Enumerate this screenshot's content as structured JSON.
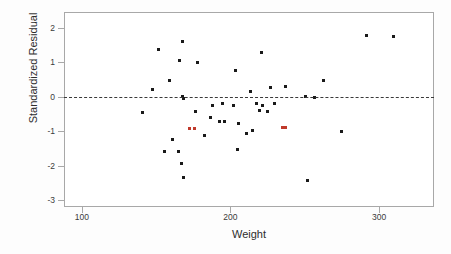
{
  "chart_data": {
    "type": "scatter",
    "title": "",
    "subtitle": "",
    "xlabel": "Weight",
    "ylabel": "Standardized Residual",
    "xlim": [
      88,
      337
    ],
    "ylim": [
      -3.2,
      2.45
    ],
    "xticks": [
      100,
      200,
      300
    ],
    "yticks": [
      2,
      1,
      0,
      -1,
      -2,
      -3
    ],
    "xtick_labels": [
      "100",
      "200",
      "300"
    ],
    "ytick_labels": [
      "2",
      "1",
      "0",
      "-1",
      "-2",
      "-3"
    ],
    "grid": false,
    "legend": "none",
    "annotations": [
      {
        "kind": "reference-line",
        "orientation": "horizontal",
        "y": 0,
        "style": "dashed",
        "color": "#3a3a3a"
      }
    ],
    "marker": {
      "shape": "square",
      "size": 3,
      "color": "#1a1a1a",
      "highlight_color": "#c0392b"
    },
    "series": [
      {
        "name": "residuals",
        "color": "#1a1a1a",
        "points": [
          {
            "x": 97,
            "y": -0.09
          },
          {
            "x": 104,
            "y": 0.59
          },
          {
            "x": 108,
            "y": 1.74
          },
          {
            "x": 115,
            "y": 0.85
          },
          {
            "x": 117,
            "y": -0.86
          },
          {
            "x": 112,
            "y": -1.22
          },
          {
            "x": 122,
            "y": 1.42
          },
          {
            "x": 124,
            "y": 1.97
          },
          {
            "x": 124,
            "y": 0.37
          },
          {
            "x": 125,
            "y": 0.32
          },
          {
            "x": 121,
            "y": -1.22
          },
          {
            "x": 123,
            "y": -1.55
          },
          {
            "x": 125,
            "y": -1.96
          },
          {
            "x": 134,
            "y": 1.36
          },
          {
            "x": 133,
            "y": -0.07
          },
          {
            "x": 139,
            "y": -0.74
          },
          {
            "x": 144,
            "y": 0.11
          },
          {
            "x": 143,
            "y": -0.23
          },
          {
            "x": 149,
            "y": -0.35
          },
          {
            "x": 152,
            "y": -0.35
          },
          {
            "x": 151,
            "y": 0.19
          },
          {
            "x": 158,
            "y": 0.12
          },
          {
            "x": 160,
            "y": 1.13
          },
          {
            "x": 162,
            "y": -0.41
          },
          {
            "x": 161,
            "y": -1.17
          },
          {
            "x": 167,
            "y": -0.69
          },
          {
            "x": 170,
            "y": 0.52
          },
          {
            "x": 171,
            "y": -0.62
          },
          {
            "x": 174,
            "y": 0.19
          },
          {
            "x": 177,
            "y": 1.65
          },
          {
            "x": 178,
            "y": 0.11
          },
          {
            "x": 176,
            "y": -0.03
          },
          {
            "x": 181,
            "y": -0.06
          },
          {
            "x": 183,
            "y": 0.64
          },
          {
            "x": 186,
            "y": 0.18
          },
          {
            "x": 193,
            "y": 0.67
          },
          {
            "x": 207,
            "y": 0.39
          },
          {
            "x": 213,
            "y": 0.35
          },
          {
            "x": 208,
            "y": -2.05
          },
          {
            "x": 219,
            "y": 0.85
          },
          {
            "x": 231,
            "y": -0.63
          },
          {
            "x": 248,
            "y": 2.16
          },
          {
            "x": 266,
            "y": 2.12
          },
          {
            "x": 330,
            "y": -2.48
          }
        ]
      },
      {
        "name": "highlighted-residuals",
        "color": "#c0392b",
        "points": [
          {
            "x": 129,
            "y": -0.56
          },
          {
            "x": 132,
            "y": -0.54
          },
          {
            "x": 191,
            "y": -0.53
          },
          {
            "x": 193,
            "y": -0.51
          }
        ]
      }
    ]
  }
}
